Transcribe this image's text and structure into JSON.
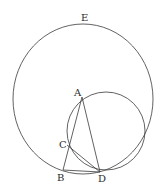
{
  "figure": {
    "type": "geometric-construction",
    "points": {
      "A": {
        "label": "A",
        "x": 82,
        "y": 97,
        "label_x": 74,
        "label_y": 96
      },
      "B": {
        "label": "B",
        "x": 63,
        "y": 170,
        "label_x": 57,
        "label_y": 181
      },
      "C": {
        "label": "C",
        "x": 67,
        "y": 145,
        "label_x": 59,
        "label_y": 148
      },
      "D": {
        "label": "D",
        "x": 100,
        "y": 172,
        "label_x": 98,
        "label_y": 182
      },
      "E": {
        "label": "E",
        "x": 85,
        "y": 24,
        "label_x": 81,
        "label_y": 21
      }
    },
    "circles": [
      {
        "name": "outer-circle",
        "through": [
          "E",
          "B",
          "D"
        ]
      },
      {
        "name": "inner-circle",
        "through": [
          "A",
          "C",
          "D"
        ]
      }
    ],
    "segments": [
      "AB",
      "AD",
      "CD",
      "BD"
    ],
    "colors": {
      "ink": "#3a3a3a",
      "background": "#ffffff"
    }
  }
}
